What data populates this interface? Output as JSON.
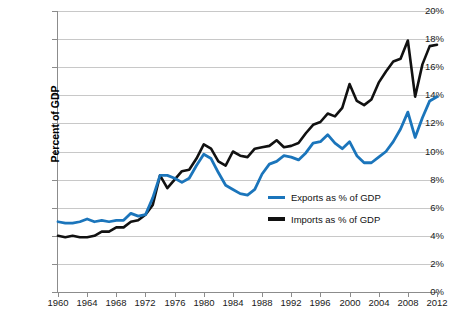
{
  "chart_data": {
    "type": "line",
    "title": "",
    "xlabel": "",
    "ylabel": "Percent of GDP",
    "xlim": [
      1960,
      2012
    ],
    "ylim": [
      0,
      20
    ],
    "y_tick_labels": [
      "20%",
      "18%",
      "16%",
      "14%",
      "12%",
      "10%",
      "8%",
      "6%",
      "4%",
      "2%",
      "0%"
    ],
    "y_tick_values": [
      20,
      18,
      16,
      14,
      12,
      10,
      8,
      6,
      4,
      2,
      0
    ],
    "x_tick_labels": [
      "1960",
      "1964",
      "1968",
      "1972",
      "1976",
      "1980",
      "1984",
      "1988",
      "1992",
      "1996",
      "2000",
      "2004",
      "2008",
      "2012"
    ],
    "x_tick_values": [
      1960,
      1964,
      1968,
      1972,
      1976,
      1980,
      1984,
      1988,
      1992,
      1996,
      2000,
      2004,
      2008,
      2012
    ],
    "grid": "horizontal",
    "legend_position": "inside-right",
    "x": [
      1960,
      1961,
      1962,
      1963,
      1964,
      1965,
      1966,
      1967,
      1968,
      1969,
      1970,
      1971,
      1972,
      1973,
      1974,
      1975,
      1976,
      1977,
      1978,
      1979,
      1980,
      1981,
      1982,
      1983,
      1984,
      1985,
      1986,
      1987,
      1988,
      1989,
      1990,
      1991,
      1992,
      1993,
      1994,
      1995,
      1996,
      1997,
      1998,
      1999,
      2000,
      2001,
      2002,
      2003,
      2004,
      2005,
      2006,
      2007,
      2008,
      2009,
      2010,
      2011,
      2012
    ],
    "series": [
      {
        "name": "Exports as % of GDP",
        "color": "#1B75BB",
        "values": [
          5.0,
          4.9,
          4.9,
          5.0,
          5.2,
          5.0,
          5.1,
          5.0,
          5.1,
          5.1,
          5.6,
          5.4,
          5.5,
          6.7,
          8.3,
          8.3,
          8.1,
          7.8,
          8.1,
          9.0,
          9.8,
          9.5,
          8.5,
          7.6,
          7.3,
          7.0,
          6.9,
          7.3,
          8.4,
          9.1,
          9.3,
          9.7,
          9.6,
          9.4,
          9.9,
          10.6,
          10.7,
          11.2,
          10.6,
          10.2,
          10.7,
          9.7,
          9.2,
          9.2,
          9.6,
          10.0,
          10.7,
          11.6,
          12.8,
          11.0,
          12.4,
          13.6,
          13.9
        ]
      },
      {
        "name": "Imports as % of GDP",
        "color": "#111111",
        "values": [
          4.0,
          3.9,
          4.0,
          3.9,
          3.9,
          4.0,
          4.3,
          4.3,
          4.6,
          4.6,
          5.0,
          5.1,
          5.5,
          6.2,
          8.3,
          7.4,
          8.0,
          8.6,
          8.7,
          9.5,
          10.5,
          10.2,
          9.3,
          9.0,
          10.0,
          9.7,
          9.6,
          10.2,
          10.3,
          10.4,
          10.8,
          10.3,
          10.4,
          10.6,
          11.3,
          11.9,
          12.1,
          12.7,
          12.5,
          13.1,
          14.8,
          13.6,
          13.3,
          13.7,
          14.9,
          15.7,
          16.4,
          16.6,
          17.9,
          13.9,
          16.2,
          17.5,
          17.6
        ]
      }
    ]
  },
  "axis": {
    "y_title": "Percent of GDP"
  },
  "legend": {
    "items": [
      {
        "label": "Exports as % of GDP",
        "color": "#1B75BB"
      },
      {
        "label": "Imports as % of GDP",
        "color": "#111111"
      }
    ]
  }
}
